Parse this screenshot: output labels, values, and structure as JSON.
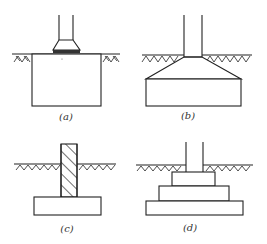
{
  "diagram": {
    "type": "foundation types",
    "stroke_color": "#222222",
    "figures": [
      {
        "id": "a",
        "label": "(a)",
        "description": "column on pedestal over large block footing"
      },
      {
        "id": "b",
        "label": "(b)",
        "description": "column on sloped (trapezoidal) spread footing"
      },
      {
        "id": "c",
        "label": "(c)",
        "description": "hatched wall on strip footing"
      },
      {
        "id": "d",
        "label": "(d)",
        "description": "column on stepped footing"
      }
    ]
  }
}
